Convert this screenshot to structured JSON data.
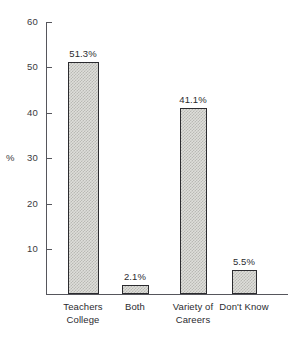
{
  "chart_data": {
    "type": "bar",
    "title": "",
    "xlabel": "",
    "ylabel": "%",
    "categories": [
      "Teachers College",
      "Both",
      "Variety of Careers",
      "Don't Know"
    ],
    "category_lines": [
      [
        "Teachers",
        "College"
      ],
      [
        "Both",
        ""
      ],
      [
        "Variety of",
        "Careers"
      ],
      [
        "Don't Know",
        ""
      ]
    ],
    "values": [
      51.3,
      2.1,
      41.1,
      5.5
    ],
    "value_labels": [
      "51.3%",
      "2.1%",
      "41.1%",
      "5.5%"
    ],
    "ylim": [
      0,
      60
    ],
    "yticks": [
      60,
      50,
      40,
      30,
      20,
      10
    ],
    "ytick_labels": [
      "60",
      "50",
      "40",
      "30",
      "20",
      "10"
    ],
    "grid": false,
    "legend": "none",
    "colors": {
      "bar_fill": "#dededa",
      "bar_hatch": "#b9b9b4",
      "bar_border": "#2b2b2f",
      "axis": "#56565c",
      "text": "#2b2b2f",
      "background": "#ffffff"
    }
  }
}
